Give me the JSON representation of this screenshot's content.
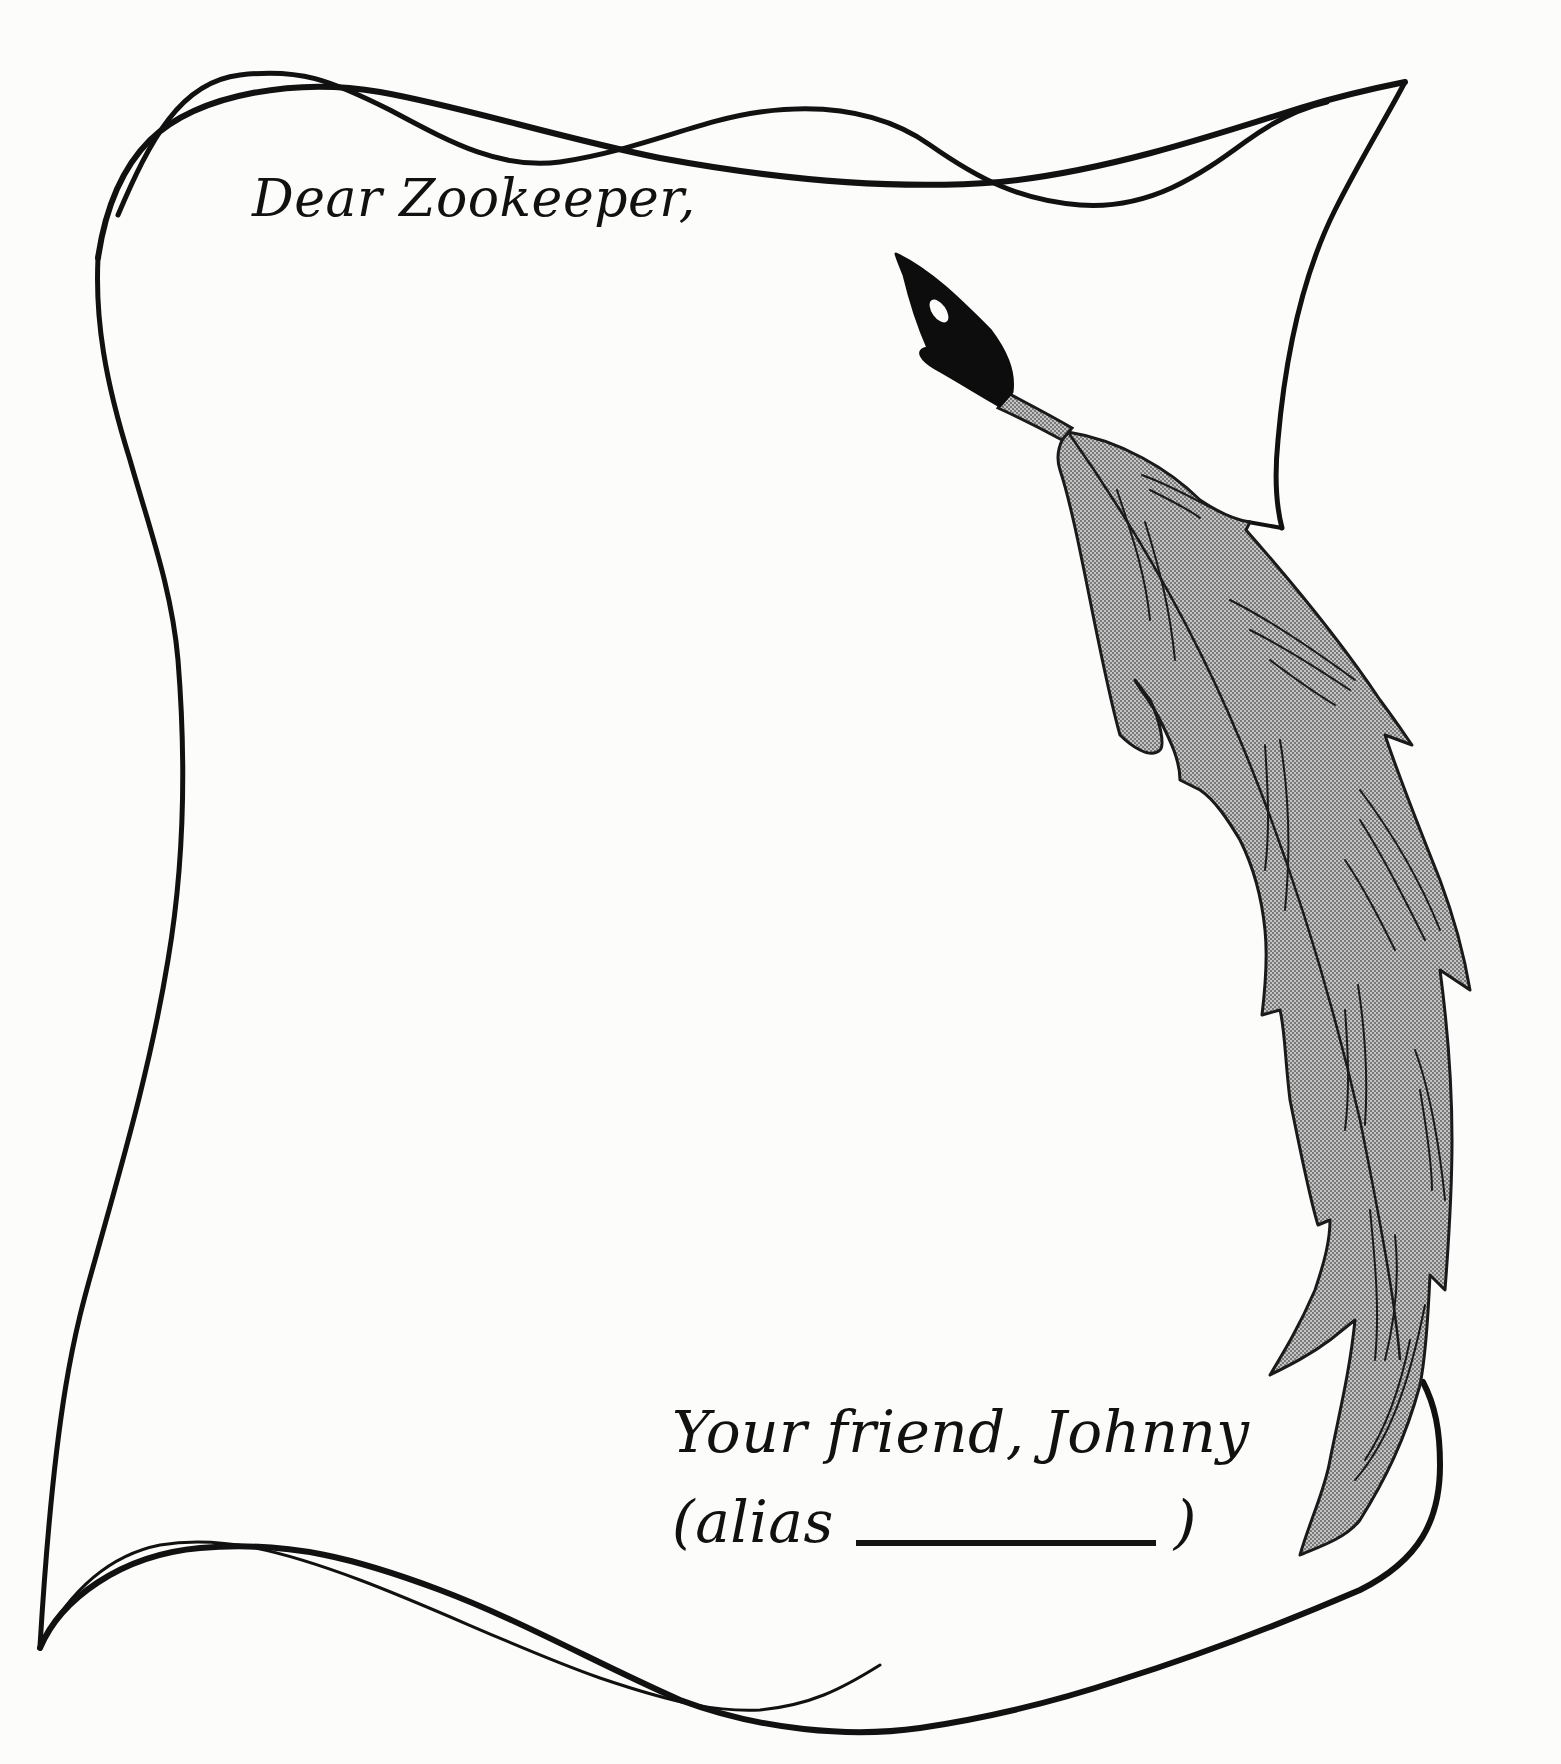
{
  "letter": {
    "greeting": "Dear Zookeeper,",
    "body": "",
    "closing": "Your friend, Johnny",
    "alias_prefix": "(alias",
    "alias_value": "",
    "alias_suffix": ")"
  },
  "illustration": {
    "scroll": "scroll-outline",
    "quill": "quill-pen",
    "outline_color": "#111111",
    "feather_fill": "#a9a9a9",
    "nib_color": "#0d0d0d"
  }
}
